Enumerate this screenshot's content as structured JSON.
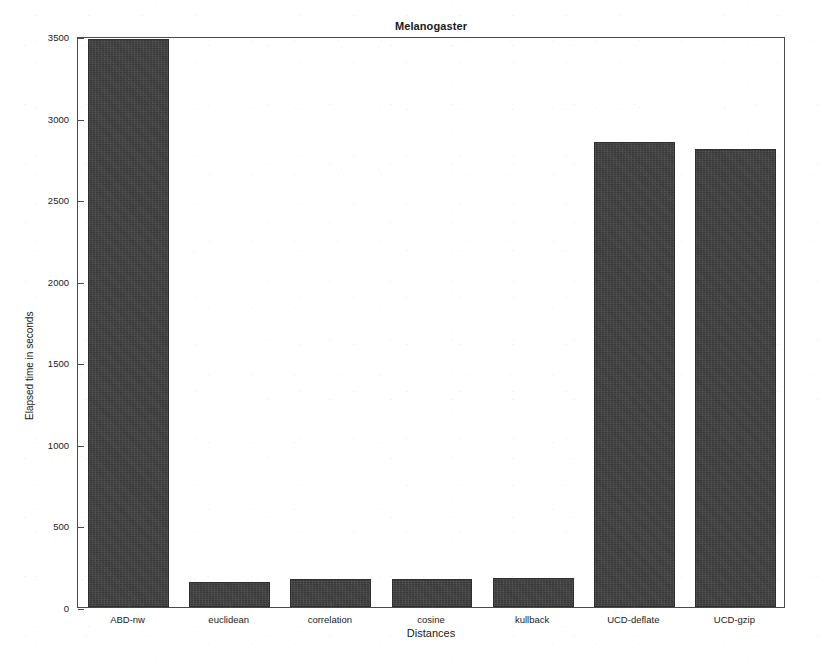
{
  "chart_data": {
    "type": "bar",
    "title": "Melanogaster",
    "xlabel": "Distances",
    "ylabel": "Elapsed time in seconds",
    "categories": [
      "ABD-nw",
      "euclidean",
      "correlation",
      "cosine",
      "kullback",
      "UCD-deflate",
      "UCD-gzip"
    ],
    "values": [
      3480,
      153,
      170,
      172,
      178,
      2849,
      2806
    ],
    "ylim": [
      0,
      3500
    ],
    "yticks": [
      0,
      500,
      1000,
      1500,
      2000,
      2500,
      3000,
      3500
    ],
    "ytick_labels": [
      "0",
      "500",
      "1000",
      "1500",
      "2000",
      "2500",
      "3000",
      "3500"
    ],
    "grid": false,
    "legend": null,
    "bar_color": "#3d3d3d",
    "axis_color": "#4a4a4a",
    "background": "#ffffff"
  }
}
